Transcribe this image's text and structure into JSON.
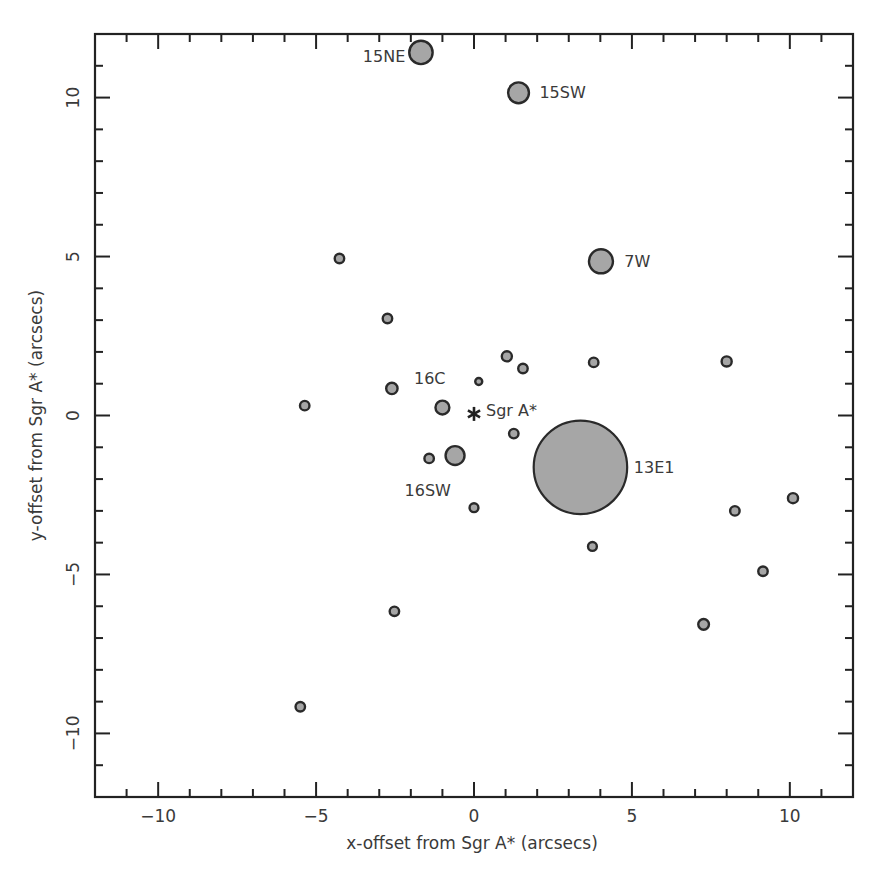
{
  "chart_data": {
    "type": "scatter",
    "title": "",
    "xlabel": "x-offset from Sgr A* (arcsecs)",
    "ylabel": "y-offset from Sgr A* (arcsecs)",
    "xlim": [
      -12,
      12
    ],
    "ylim": [
      -12,
      12
    ],
    "x_ticks": [
      -10,
      -5,
      0,
      5,
      10
    ],
    "y_ticks": [
      -10,
      -5,
      0,
      5,
      10
    ],
    "x_tick_labels": [
      "−10",
      "−5",
      "0",
      "5",
      "10"
    ],
    "y_tick_labels": [
      "−10",
      "−5",
      "0",
      "5",
      "10"
    ],
    "minor_tick_step": 1,
    "grid": false,
    "legend": null,
    "marker_fill": "#a6a6a6",
    "marker_stroke": "#2a2a2a",
    "reference": {
      "label": "Sgr A*",
      "x": 0.0,
      "y": 0.05,
      "marker": "asterisk"
    },
    "points": [
      {
        "label": "13E1",
        "x": 3.37,
        "y": -1.63,
        "r": 1.48,
        "label_dx": 0.35,
        "label_dy": 0
      },
      {
        "label": "15NE",
        "x": -1.68,
        "y": 11.42,
        "r": 0.37,
        "label_dx": -0.55,
        "label_dy": -0.1,
        "anchor": "end"
      },
      {
        "label": "15SW",
        "x": 1.41,
        "y": 10.15,
        "r": 0.33,
        "label_dx": 0.55,
        "label_dy": 0
      },
      {
        "label": "7W",
        "x": 4.02,
        "y": 4.85,
        "r": 0.38,
        "label_dx": 0.6,
        "label_dy": 0
      },
      {
        "label": "16C",
        "x": -1.0,
        "y": 0.25,
        "r": 0.22,
        "label_dx": -0.25,
        "label_dy": 0.65
      },
      {
        "label": "16SW",
        "x": -0.6,
        "y": -1.26,
        "r": 0.3,
        "label_dx": -0.4,
        "label_dy": -0.85
      },
      {
        "label": "",
        "x": -4.26,
        "y": 4.94,
        "r": 0.15
      },
      {
        "label": "",
        "x": -2.74,
        "y": 3.05,
        "r": 0.15
      },
      {
        "label": "",
        "x": -2.6,
        "y": 0.85,
        "r": 0.18
      },
      {
        "label": "",
        "x": -5.36,
        "y": 0.31,
        "r": 0.15
      },
      {
        "label": "",
        "x": 0.15,
        "y": 1.07,
        "r": 0.11
      },
      {
        "label": "",
        "x": 1.04,
        "y": 1.86,
        "r": 0.16
      },
      {
        "label": "",
        "x": 1.55,
        "y": 1.48,
        "r": 0.15
      },
      {
        "label": "",
        "x": 3.79,
        "y": 1.67,
        "r": 0.15
      },
      {
        "label": "",
        "x": 8.0,
        "y": 1.7,
        "r": 0.16
      },
      {
        "label": "",
        "x": 1.26,
        "y": -0.57,
        "r": 0.15
      },
      {
        "label": "",
        "x": -1.42,
        "y": -1.35,
        "r": 0.15
      },
      {
        "label": "",
        "x": 0.0,
        "y": -2.9,
        "r": 0.14
      },
      {
        "label": "",
        "x": 3.75,
        "y": -4.12,
        "r": 0.14
      },
      {
        "label": "",
        "x": 10.1,
        "y": -2.6,
        "r": 0.16
      },
      {
        "label": "",
        "x": 8.26,
        "y": -3.0,
        "r": 0.15
      },
      {
        "label": "",
        "x": 9.15,
        "y": -4.9,
        "r": 0.15
      },
      {
        "label": "",
        "x": 7.27,
        "y": -6.57,
        "r": 0.17
      },
      {
        "label": "",
        "x": -2.52,
        "y": -6.16,
        "r": 0.15
      },
      {
        "label": "",
        "x": -5.5,
        "y": -9.16,
        "r": 0.15
      }
    ]
  }
}
